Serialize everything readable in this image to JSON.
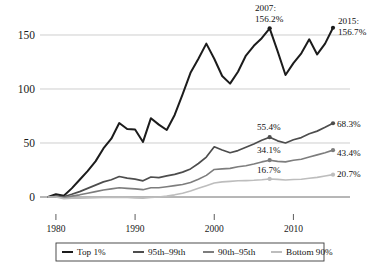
{
  "chart_data": {
    "type": "line",
    "title": "",
    "subtitle": "",
    "xlabel": "",
    "ylabel": "",
    "xlim": [
      1979,
      2015
    ],
    "ylim": [
      -4,
      170
    ],
    "grid": true,
    "grid_axis": "y",
    "legend_position": "bottom",
    "yticks": [
      0,
      50,
      100,
      150
    ],
    "ytick_labels": [
      "0",
      "50",
      "100",
      "150"
    ],
    "xticks": [
      1980,
      1990,
      2000,
      2010
    ],
    "xtick_labels": [
      "1980",
      "1990",
      "2000",
      "2010"
    ],
    "x": [
      1979,
      1980,
      1981,
      1982,
      1983,
      1984,
      1985,
      1986,
      1987,
      1988,
      1989,
      1990,
      1991,
      1992,
      1993,
      1994,
      1995,
      1996,
      1997,
      1998,
      1999,
      2000,
      2001,
      2002,
      2003,
      2004,
      2005,
      2006,
      2007,
      2008,
      2009,
      2010,
      2011,
      2012,
      2013,
      2014,
      2015
    ],
    "series": [
      {
        "name": "Top 1%",
        "color": "#1c1c1c",
        "width": 2.0,
        "values": [
          0,
          2.5,
          1.2,
          8.0,
          16.0,
          24.0,
          33.0,
          45.0,
          54.0,
          68.5,
          63.0,
          62.5,
          51.0,
          73.0,
          67.0,
          62.0,
          76.0,
          95.0,
          115.0,
          128.0,
          142.0,
          128.0,
          112.0,
          105.0,
          116.0,
          131.0,
          140.0,
          147.0,
          156.2,
          135.0,
          113.0,
          124.0,
          133.0,
          146.0,
          132.0,
          142.0,
          156.7
        ]
      },
      {
        "name": "95th–99th",
        "color": "#4d4d4d",
        "width": 1.7,
        "values": [
          0,
          0.8,
          0.2,
          2.5,
          5.0,
          8.0,
          11.0,
          14.0,
          16.0,
          19.0,
          17.5,
          16.5,
          15.0,
          18.5,
          18.0,
          19.5,
          21.0,
          23.0,
          26.0,
          31.0,
          37.0,
          46.5,
          43.5,
          41.0,
          43.0,
          46.0,
          49.0,
          52.5,
          55.4,
          52.0,
          50.0,
          53.0,
          55.0,
          58.5,
          61.0,
          64.5,
          68.3
        ]
      },
      {
        "name": "90th–95th",
        "color": "#7d7d7d",
        "width": 1.6,
        "values": [
          0,
          0.3,
          -0.6,
          0.8,
          2.0,
          3.5,
          5.0,
          6.5,
          7.5,
          8.5,
          8.0,
          7.5,
          6.8,
          8.5,
          8.5,
          9.5,
          10.5,
          11.5,
          13.5,
          16.5,
          20.0,
          25.5,
          26.0,
          26.5,
          28.0,
          29.0,
          30.5,
          32.5,
          34.1,
          33.0,
          32.5,
          34.0,
          35.0,
          37.0,
          39.0,
          41.0,
          43.4
        ]
      },
      {
        "name": "Bottom 90%",
        "color": "#bdbdbd",
        "width": 1.6,
        "values": [
          0,
          0.0,
          -1.5,
          -1.2,
          -1.0,
          -0.8,
          -0.6,
          -0.5,
          -0.4,
          -0.3,
          -0.5,
          -0.8,
          -1.0,
          -0.5,
          0.0,
          0.8,
          2.0,
          3.5,
          5.5,
          8.0,
          10.5,
          13.0,
          14.0,
          14.5,
          15.0,
          15.2,
          15.5,
          16.0,
          16.7,
          16.3,
          15.8,
          16.2,
          16.5,
          17.3,
          18.2,
          19.4,
          20.7
        ]
      }
    ],
    "annotations": [
      {
        "name": "top1-2007",
        "text_lines": [
          "2007:",
          "156.2%"
        ],
        "x": 2007,
        "y": 156.2,
        "marker": true
      },
      {
        "name": "top1-2015",
        "text_lines": [
          "2015:",
          "156.7%"
        ],
        "x": 2015,
        "y": 156.7,
        "marker": true
      },
      {
        "name": "p95-2007",
        "text_lines": [
          "55.4%"
        ],
        "x": 2007,
        "y": 55.4,
        "marker": true
      },
      {
        "name": "p95-2015",
        "text_lines": [
          "68.3%"
        ],
        "x": 2015,
        "y": 68.3,
        "marker": true
      },
      {
        "name": "p90-2007",
        "text_lines": [
          "34.1%"
        ],
        "x": 2007,
        "y": 34.1,
        "marker": true
      },
      {
        "name": "p90-2015",
        "text_lines": [
          "43.4%"
        ],
        "x": 2015,
        "y": 43.4,
        "marker": true
      },
      {
        "name": "bottom90-2007",
        "text_lines": [
          "16.7%"
        ],
        "x": 2007,
        "y": 16.7,
        "marker": true
      },
      {
        "name": "bottom90-2015",
        "text_lines": [
          "20.7%"
        ],
        "x": 2015,
        "y": 20.7,
        "marker": true
      }
    ]
  },
  "axis": {
    "y_labels": {
      "t150": "150",
      "t100": "100",
      "t50": "50",
      "t0": "0"
    },
    "x_labels": {
      "t1980": "1980",
      "t1990": "1990",
      "t2000": "2000",
      "t2010": "2010"
    }
  },
  "annotations_text": {
    "a2007_year": "2007:",
    "a2007_value": "156.2%",
    "a2015_year": "2015:",
    "a2015_value": "156.7%",
    "p95_2007": "55.4%",
    "p95_2015": "68.3%",
    "p90_2007": "34.1%",
    "p90_2015": "43.4%",
    "b90_2007": "16.7%",
    "b90_2015": "20.7%"
  },
  "legend": {
    "items": [
      {
        "label": "Top 1%",
        "color": "#1c1c1c"
      },
      {
        "label": "95th–99th",
        "color": "#4d4d4d"
      },
      {
        "label": "90th–95th",
        "color": "#7d7d7d"
      },
      {
        "label": "Bottom 90%",
        "color": "#bdbdbd"
      }
    ]
  }
}
